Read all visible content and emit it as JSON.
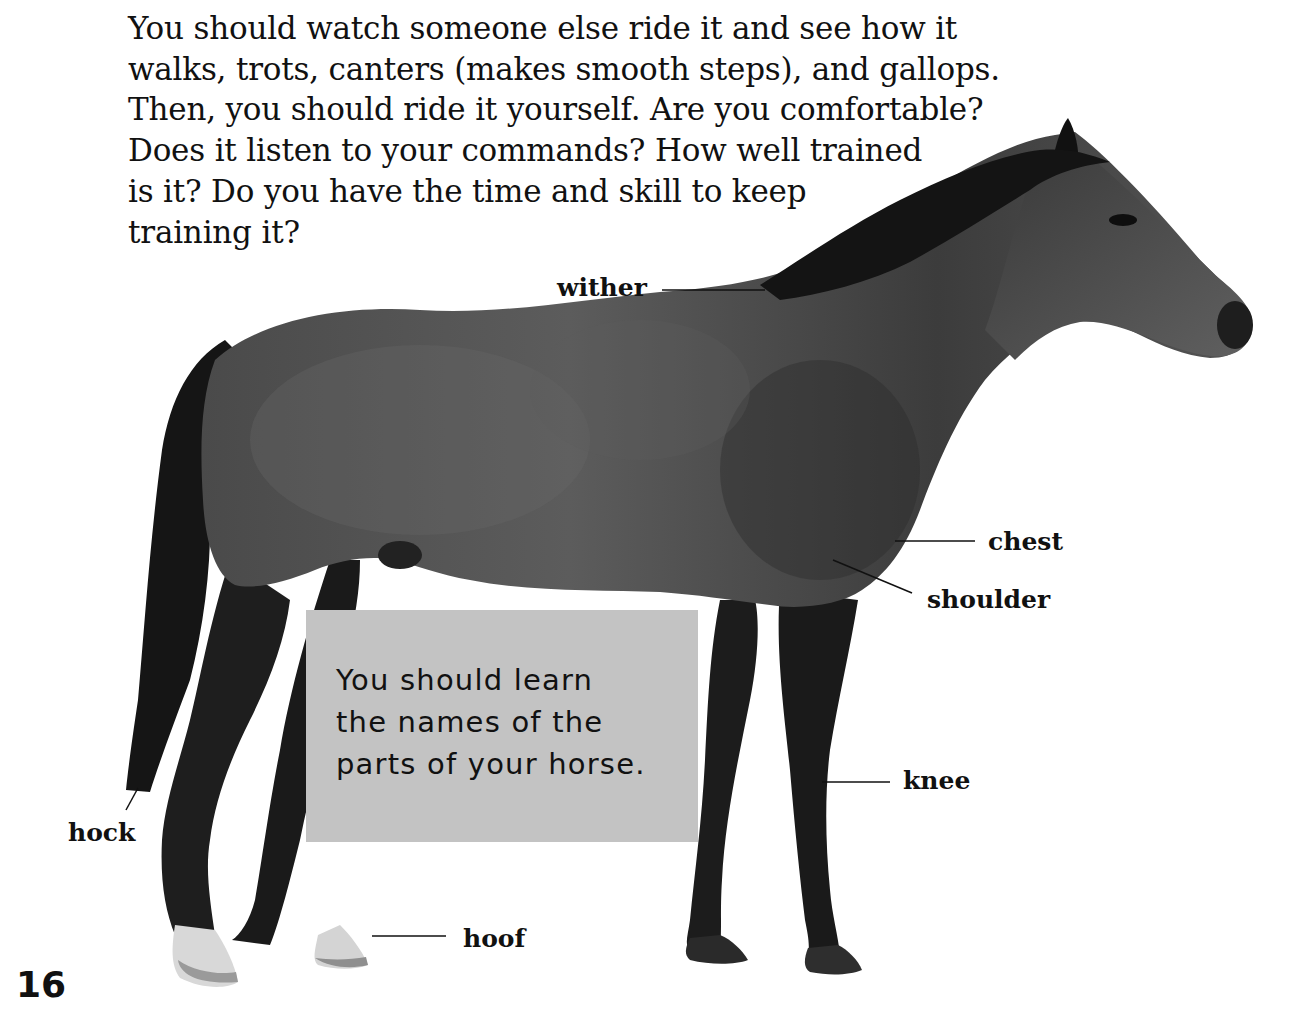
{
  "intro_text": {
    "lines": [
      "You should watch someone else ride it and see how it",
      "walks, trots, canters (makes smooth steps), and gallops.",
      "Then, you should ride it yourself. Are you comfortable?",
      "Does it listen to your commands? How well trained",
      "is it? Do you have the time and skill to keep",
      "training it?"
    ]
  },
  "callout": {
    "lines": [
      "You should learn",
      "the names of the",
      "parts of your horse."
    ],
    "background": "#c3c3c3"
  },
  "labels": {
    "wither": "wither",
    "chest": "chest",
    "shoulder": "shoulder",
    "knee": "knee",
    "hock": "hock",
    "hoof": "hoof"
  },
  "image": {
    "subject": "horse-photo",
    "description": "Dark bay horse standing in profile facing right"
  },
  "page_number": "16"
}
